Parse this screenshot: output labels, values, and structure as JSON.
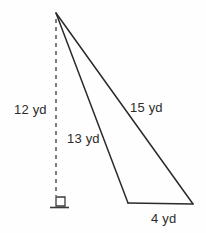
{
  "figure": {
    "type": "geometry-diagram",
    "shape": "triangle-with-altitude",
    "units": "yd",
    "background_color": "#fefefe",
    "stroke_color": "#2a2a2a"
  },
  "labels": {
    "altitude": "12 yd",
    "side_near": "13 yd",
    "side_far": "15 yd",
    "base": "4 yd"
  },
  "geometry": {
    "apex": {
      "x": 56,
      "y": 13
    },
    "foot_of_altitude": {
      "x": 56,
      "y": 196
    },
    "base_left": {
      "x": 128,
      "y": 203
    },
    "base_right": {
      "x": 193,
      "y": 204
    },
    "altitude_line": {
      "name": "dashed-altitude",
      "style": "dashed",
      "x1": 56,
      "y1": 19,
      "x2": 56,
      "y2": 196,
      "dash_on": 4,
      "dash_off": 4
    },
    "side_near_line": {
      "x1": 56,
      "y1": 13,
      "x2": 128,
      "y2": 203
    },
    "side_far_line": {
      "x1": 56,
      "y1": 13,
      "x2": 193,
      "y2": 204
    },
    "base_line": {
      "x1": 128,
      "y1": 203,
      "x2": 193,
      "y2": 204
    },
    "right_angle_marker": {
      "name": "right-angle-square",
      "x": 56,
      "y": 197,
      "size": 9
    },
    "ground_tick": {
      "x1": 50,
      "y1": 207.5,
      "x2": 69,
      "y2": 207.5
    }
  },
  "chart_data": {
    "type": "diagram",
    "title": "",
    "measurements": [
      {
        "name": "altitude",
        "label": "12 yd",
        "value": 12,
        "unit": "yd"
      },
      {
        "name": "side_near",
        "label": "13 yd",
        "value": 13,
        "unit": "yd"
      },
      {
        "name": "side_far",
        "label": "15 yd",
        "value": 15,
        "unit": "yd"
      },
      {
        "name": "base",
        "label": "4 yd",
        "value": 4,
        "unit": "yd"
      }
    ]
  }
}
